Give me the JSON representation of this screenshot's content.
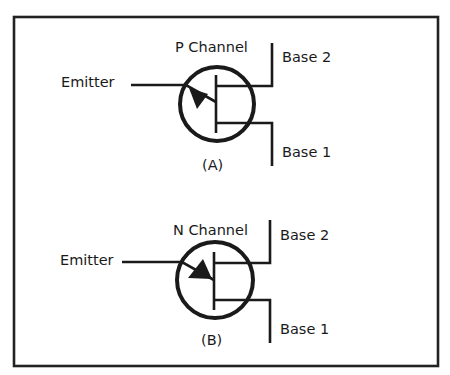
{
  "figure": {
    "colors": {
      "ink": "#1a1a1a",
      "background": "#ffffff"
    },
    "symbols": [
      {
        "id": "A",
        "channel_label": "P Channel",
        "caption": "(A)",
        "emitter_label": "Emitter",
        "base2_label": "Base 2",
        "base1_label": "Base 1",
        "arrow_direction": "outward-from-bar"
      },
      {
        "id": "B",
        "channel_label": "N Channel",
        "caption": "(B)",
        "emitter_label": "Emitter",
        "base2_label": "Base 2",
        "base1_label": "Base 1",
        "arrow_direction": "inward-to-bar"
      }
    ]
  }
}
